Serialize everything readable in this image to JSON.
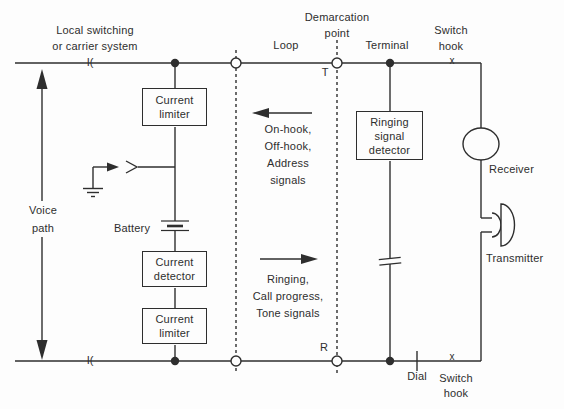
{
  "colors": {
    "ink": "#2e2e2e",
    "background": "#fdfdfd"
  },
  "labels": {
    "local_switching": [
      "Local switching",
      "or carrier system"
    ],
    "loop": "Loop",
    "demarcation_point": [
      "Demarcation",
      "point"
    ],
    "terminal": "Terminal",
    "switch_hook_top": [
      "Switch",
      "hook"
    ],
    "voice_path": [
      "Voice",
      "path"
    ],
    "battery": "Battery",
    "receiver": "Receiver",
    "transmitter": "Transmitter",
    "dial": "Dial",
    "switch_hook_bottom": [
      "Switch",
      "hook"
    ],
    "tip_mark": "T",
    "ring_mark": "R",
    "hook_contact_top": "x",
    "hook_contact_bottom": "x",
    "line_coil_top": "I(",
    "line_coil_bottom": "I("
  },
  "boxes": {
    "current_limiter_top": [
      "Current",
      "limiter"
    ],
    "current_detector": [
      "Current",
      "detector"
    ],
    "current_limiter_bottom": [
      "Current",
      "limiter"
    ],
    "ringing_signal_detector": [
      "Ringing",
      "signal",
      "detector"
    ]
  },
  "signals": {
    "upstream": [
      "On-hook,",
      "Off-hook,",
      "Address",
      "signals"
    ],
    "downstream": [
      "Ringing,",
      "Call progress,",
      "Tone signals"
    ]
  },
  "symbols": {
    "ground": "ground-icon",
    "battery": "battery-icon",
    "capacitor": "capacitor-icon",
    "receiver": "receiver-circle-icon",
    "transmitter": "transmitter-speaker-icon",
    "voice_path_arrow": "double-headed-arrow-icon",
    "dial_contact": "dial-tick-icon"
  }
}
